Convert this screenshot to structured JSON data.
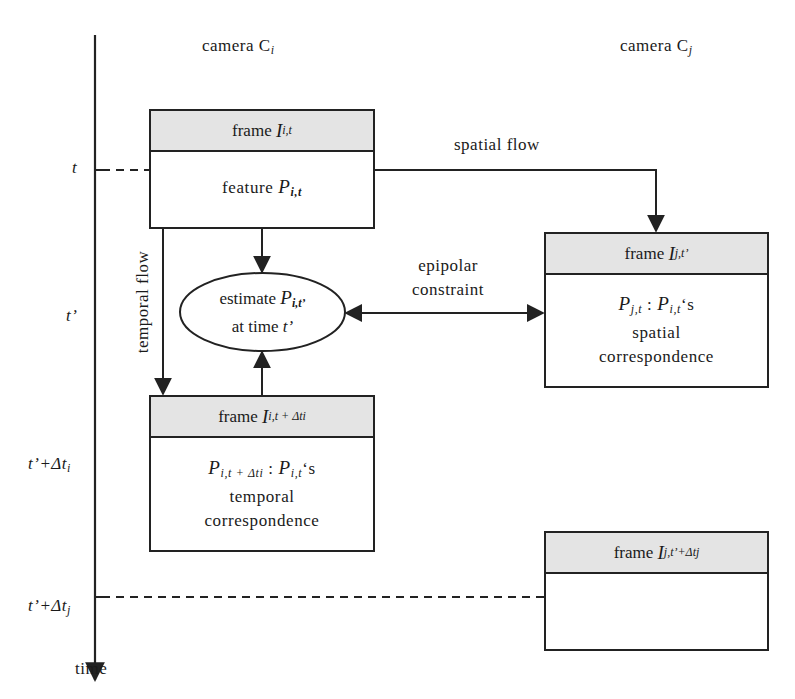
{
  "diagram": {
    "cameras": {
      "ci": {
        "text": "camera C",
        "sub": "i"
      },
      "cj": {
        "text": "camera C",
        "sub": "j"
      }
    },
    "time_axis": {
      "label": "time",
      "ticks": [
        {
          "id": "t",
          "main": "t",
          "sub": ""
        },
        {
          "id": "t_prime",
          "main": "t’",
          "sub": ""
        },
        {
          "id": "t_prime_dti",
          "main": "t’+Δt",
          "sub": "i"
        },
        {
          "id": "t_prime_dtj",
          "main": "t’+Δt",
          "sub": "j"
        }
      ]
    },
    "boxes": {
      "frame_it": {
        "header_word": "frame ",
        "header_sym": "I",
        "header_sub": "i,t",
        "body_word": "feature ",
        "body_sym": "P",
        "body_sub": "i,t"
      },
      "frame_it_dti": {
        "header_word": "frame ",
        "header_sym": "I",
        "header_sub": "i,t + Δti",
        "body_line1_sym1": "P",
        "body_line1_sub1": "i,t + Δti",
        "body_line1_sep": " : ",
        "body_line1_sym2": "P",
        "body_line1_sub2": "i,t",
        "body_line1_tail": "‘s",
        "body_line2": "temporal",
        "body_line3": "correspondence"
      },
      "frame_jt": {
        "header_word": "frame ",
        "header_sym": "I",
        "header_sub": "j,t’",
        "body_line1_sym1": "P",
        "body_line1_sub1": "j,t",
        "body_line1_sep": " : ",
        "body_line1_sym2": "P",
        "body_line1_sub2": "i,t",
        "body_line1_tail": "‘s",
        "body_line2": "spatial",
        "body_line3": "correspondence"
      },
      "frame_jt_dtj": {
        "header_word": "frame ",
        "header_sym": "I",
        "header_sub": "j,t’+Δtj"
      }
    },
    "ellipse": {
      "line1_word": "estimate ",
      "line1_sym": "P",
      "line1_sub": "i,t’",
      "line2_word": "at time ",
      "line2_sym": "t’"
    },
    "flows": {
      "spatial": "spatial flow",
      "temporal": "temporal flow",
      "epipolar_line1": "epipolar",
      "epipolar_line2": "constraint"
    },
    "colors": {
      "line": "#222222",
      "header_fill": "#e4e4e4",
      "background": "#ffffff"
    }
  }
}
